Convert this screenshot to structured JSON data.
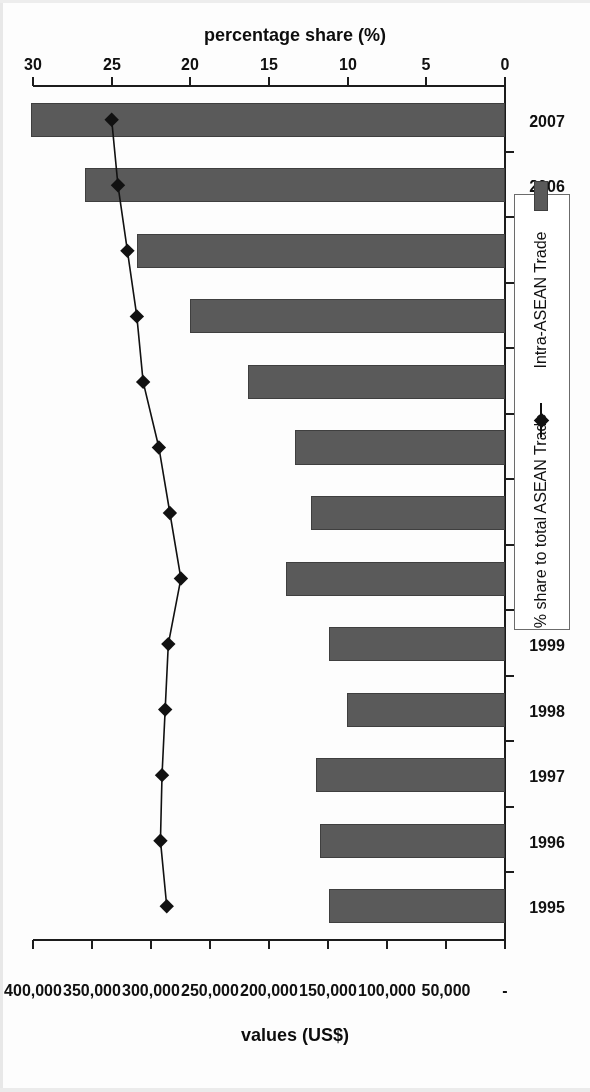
{
  "chart_data": {
    "type": "bar",
    "title": "",
    "orientation": "horizontal-rotated-180",
    "categories": [
      "1995",
      "1996",
      "1997",
      "1998",
      "1999",
      "2000",
      "2001",
      "2002",
      "2003",
      "2004",
      "2005",
      "2006",
      "2007"
    ],
    "xlabel": "",
    "ylabel": "values (US$)",
    "y2label": "percentage share (%)",
    "ylim": [
      0,
      400000
    ],
    "y2lim": [
      0,
      30
    ],
    "grid": false,
    "legend_position": "right",
    "series": [
      {
        "name": "Intra-ASEAN Trade",
        "type": "bar",
        "axis": "values",
        "color": "#5a5a5a",
        "values": [
          149000,
          157000,
          160000,
          134000,
          149000,
          186000,
          164000,
          178000,
          218000,
          267000,
          312000,
          356000,
          402000
        ]
      },
      {
        "name": "% share to total ASEAN Trade",
        "type": "line",
        "axis": "percentage",
        "color": "#111111",
        "marker": "diamond",
        "values": [
          21.5,
          21.9,
          21.8,
          21.6,
          21.4,
          20.6,
          21.3,
          22.0,
          23.0,
          23.4,
          24.0,
          24.6,
          25.0
        ]
      }
    ],
    "value_axis_ticks": [
      "-",
      "50,000",
      "100,000",
      "150,000",
      "200,000",
      "250,000",
      "300,000",
      "350,000",
      "400,000"
    ],
    "value_axis_tick_values": [
      0,
      50000,
      100000,
      150000,
      200000,
      250000,
      300000,
      350000,
      400000
    ],
    "percent_axis_ticks": [
      "0",
      "5",
      "10",
      "15",
      "20",
      "25",
      "30"
    ],
    "percent_axis_tick_values": [
      0,
      5,
      10,
      15,
      20,
      25,
      30
    ]
  },
  "axes": {
    "percentage_title": "percentage share (%)",
    "values_title": "values (US$)"
  },
  "legend": {
    "entries": [
      {
        "label": "Intra-ASEAN Trade",
        "kind": "bar-swatch"
      },
      {
        "label": "% share to total ASEAN Trade",
        "kind": "line-diamond-swatch"
      }
    ]
  }
}
